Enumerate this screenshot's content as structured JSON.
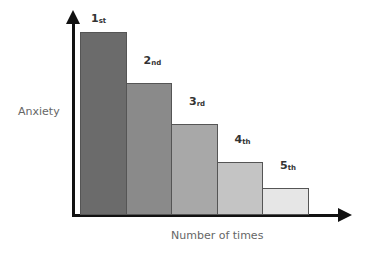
{
  "chart_data": {
    "type": "bar",
    "title": "",
    "xlabel": "Number of times",
    "ylabel": "Anxiety",
    "categories": [
      "1st",
      "2nd",
      "3rd",
      "4th",
      "5th"
    ],
    "category_labels": [
      {
        "num": "1",
        "suffix": "st"
      },
      {
        "num": "2",
        "suffix": "nd"
      },
      {
        "num": "3",
        "suffix": "rd"
      },
      {
        "num": "4",
        "suffix": "th"
      },
      {
        "num": "5",
        "suffix": "th"
      }
    ],
    "values": [
      100,
      72,
      50,
      29,
      15
    ],
    "colors": [
      "#6b6b6b",
      "#8a8a8a",
      "#a8a8a8",
      "#c4c4c4",
      "#e6e6e6"
    ],
    "ylim": [
      0,
      100
    ],
    "grid": false,
    "legend": null
  }
}
